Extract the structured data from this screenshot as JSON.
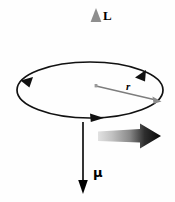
{
  "figure": {
    "kind": "physics-vector-diagram",
    "background_color": "#fefefe",
    "width": 175,
    "height": 202,
    "labels": {
      "angular_momentum": "L",
      "radius": "r",
      "magnetic_moment": "μ"
    },
    "colors": {
      "angular_momentum_arrow": "#8e8e8e",
      "magnetic_moment_arrow": "#000000",
      "loop_stroke": "#111111",
      "radius_stroke": "#7d7d7d",
      "rotation_arrow_dark": "#0b0b0b",
      "rotation_arrow_light": "#d8d8d8",
      "text": "#000000"
    },
    "elements": {
      "angular_momentum_vector": {
        "name": "L",
        "direction": "up",
        "color": "#8e8e8e",
        "tail": [
          96,
          88
        ],
        "head": [
          96,
          12
        ]
      },
      "magnetic_moment_vector": {
        "name": "μ",
        "direction": "down",
        "color": "#000000",
        "tail": [
          83,
          122
        ],
        "head": [
          83,
          192
        ]
      },
      "current_loop": {
        "name": "current loop",
        "shape": "ellipse",
        "center": [
          90,
          90
        ],
        "radius_x": 73,
        "radius_y": 28,
        "circulation": "counterclockwise viewed from above",
        "arrowhead_count": 3
      },
      "radius_vector": {
        "name": "r",
        "from": [
          96,
          86
        ],
        "to": [
          159,
          101
        ],
        "color": "#7d7d7d"
      },
      "rotation_indicator": {
        "name": "rotation direction",
        "direction": "right",
        "style": "thick tapered gradient arrow",
        "from": [
          98,
          136
        ],
        "to": [
          160,
          136
        ]
      }
    }
  }
}
